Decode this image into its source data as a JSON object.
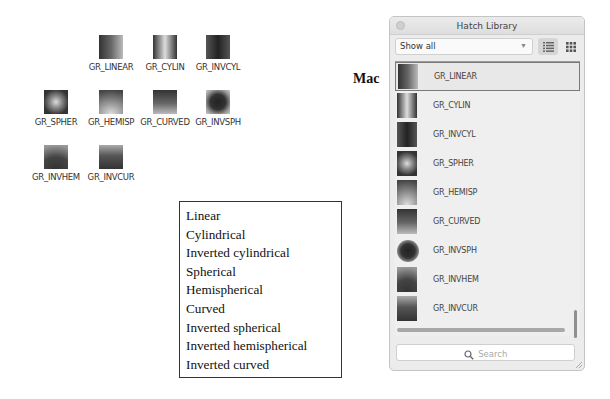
{
  "windows_grid": {
    "items": [
      {
        "label": "GR_LINEAR",
        "pattern": "linear"
      },
      {
        "label": "GR_CYLIN",
        "pattern": "cylindrical"
      },
      {
        "label": "GR_INVCYL",
        "pattern": "inverted-cylindrical"
      },
      {
        "label": "GR_SPHER",
        "pattern": "spherical"
      },
      {
        "label": "GR_HEMISP",
        "pattern": "hemispherical"
      },
      {
        "label": "GR_CURVED",
        "pattern": "curved"
      },
      {
        "label": "GR_INVSPH",
        "pattern": "inverted-spherical"
      },
      {
        "label": "GR_INVHEM",
        "pattern": "inverted-hemispherical"
      },
      {
        "label": "GR_INVCUR",
        "pattern": "inverted-curved"
      }
    ]
  },
  "description_list": [
    "Linear",
    "Cylindrical",
    "Inverted cylindrical",
    "Spherical",
    "Hemispherical",
    "Curved",
    "Inverted spherical",
    "Inverted hemispherical",
    "Inverted curved"
  ],
  "mac_label": "Mac",
  "hatch_library": {
    "title": "Hatch Library",
    "filter": {
      "value": "Show all",
      "icon": "chevron-down-icon"
    },
    "view_buttons": [
      {
        "name": "list-view",
        "icon": "list-icon",
        "active": true
      },
      {
        "name": "grid-view",
        "icon": "grid-icon",
        "active": false
      }
    ],
    "items": [
      {
        "label": "GR_LINEAR",
        "selected": true
      },
      {
        "label": "GR_CYLIN",
        "selected": false
      },
      {
        "label": "GR_INVCYL",
        "selected": false
      },
      {
        "label": "GR_SPHER",
        "selected": false
      },
      {
        "label": "GR_HEMISP",
        "selected": false
      },
      {
        "label": "GR_CURVED",
        "selected": false
      },
      {
        "label": "GR_INVSPH",
        "selected": false
      },
      {
        "label": "GR_INVHEM",
        "selected": false
      },
      {
        "label": "GR_INVCUR",
        "selected": false
      }
    ],
    "search": {
      "placeholder": "Search",
      "icon": "search-icon"
    }
  }
}
